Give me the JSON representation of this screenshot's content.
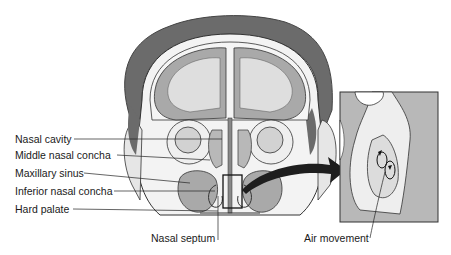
{
  "figure": {
    "type": "anatomical-diagram",
    "colors": {
      "hair": "#6b6b6b",
      "skin": "#d6d6d6",
      "bone_light": "#f2f2f2",
      "gray_matter": "#a9a9a9",
      "white_matter": "#dedede",
      "tissue": "#b8b8b8",
      "outline": "#333333",
      "arrow": "#1e1e1e"
    }
  },
  "labels": {
    "left": [
      {
        "id": "nasal-cavity",
        "text": "Nasal cavity"
      },
      {
        "id": "middle-nasal-concha",
        "text": "Middle nasal concha"
      },
      {
        "id": "maxillary-sinus",
        "text": "Maxillary sinus"
      },
      {
        "id": "inferior-nasal-concha",
        "text": "Inferior nasal concha"
      },
      {
        "id": "hard-palate",
        "text": "Hard palate"
      }
    ],
    "bottom": [
      {
        "id": "nasal-septum",
        "text": "Nasal septum"
      },
      {
        "id": "air-movement",
        "text": "Air movement"
      }
    ]
  },
  "inset": {
    "description": "Magnified view of inferior nasal concha region showing circular airflow arrows"
  }
}
